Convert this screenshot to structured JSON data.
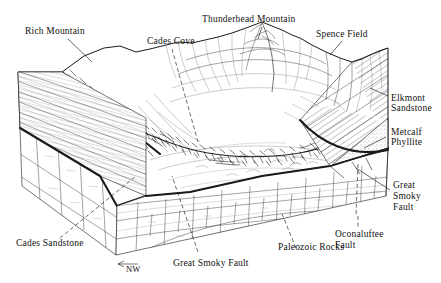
{
  "figure": {
    "kind": "geologic-block-diagram",
    "background_color": "#ffffff",
    "ink_color": "#1a1a1a",
    "width": 441,
    "height": 283
  },
  "labels": {
    "rich_mountain": "Rich Mountain",
    "cades_cove": "Cades Cove",
    "thunderhead_mountain": "Thunderhead Mountain",
    "spence_field": "Spence Field",
    "elkmont_sandstone_l1": "Elkmont",
    "elkmont_sandstone_l2": "Sandstone",
    "metcalf_phyllite_l1": "Metcalf",
    "metcalf_phyllite_l2": "Phyllite",
    "great_smoky_fault_right_l1": "Great",
    "great_smoky_fault_right_l2": "Smoky",
    "great_smoky_fault_right_l3": "Fault",
    "oconaluftee_fault_l1": "Oconaluftee",
    "oconaluftee_fault_l2": "Fault",
    "paleozoic_rocks": "Paleozoic Rocks",
    "great_smoky_fault_front": "Great Smoky Fault",
    "cades_sandstone": "Cades Sandstone",
    "direction_nw": "NW"
  },
  "units": [
    {
      "name": "Elkmont Sandstone",
      "face": "right",
      "pattern": "diagonal-hatch"
    },
    {
      "name": "Metcalf Phyllite",
      "face": "right",
      "pattern": "stipple"
    },
    {
      "name": "Cades Sandstone",
      "face": "left",
      "pattern": "horizontal-bedding"
    },
    {
      "name": "Paleozoic Rocks",
      "face": "front-and-left-lower",
      "pattern": "blocky-limestone"
    }
  ],
  "faults": [
    {
      "name": "Great Smoky Fault",
      "style": "heavy-solid"
    },
    {
      "name": "Oconaluftee Fault",
      "style": "dashed-vertical"
    }
  ],
  "peaks": [
    "Rich Mountain",
    "Thunderhead Mountain",
    "Spence Field"
  ],
  "leaders": [
    {
      "label": "Rich Mountain",
      "style": "solid"
    },
    {
      "label": "Cades Cove",
      "style": "dashed"
    },
    {
      "label": "Thunderhead Mountain",
      "style": "solid"
    },
    {
      "label": "Spence Field",
      "style": "solid"
    },
    {
      "label": "Elkmont Sandstone",
      "style": "solid"
    },
    {
      "label": "Metcalf Phyllite",
      "style": "solid"
    },
    {
      "label": "Great Smoky Fault",
      "style": "solid"
    },
    {
      "label": "Oconaluftee Fault",
      "style": "dashed"
    },
    {
      "label": "Paleozoic Rocks",
      "style": "dashed"
    },
    {
      "label": "Great Smoky Fault",
      "style": "dashed"
    },
    {
      "label": "Cades Sandstone",
      "style": "dashed"
    }
  ]
}
